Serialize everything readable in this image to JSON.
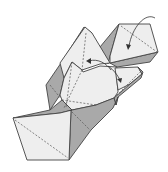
{
  "diagram": {
    "type": "origami-fold-step",
    "colors": {
      "paper_front": "#eeeeee",
      "paper_back": "#a9a9a9",
      "outline": "#444444",
      "arrow": "#333333"
    },
    "arrows": [
      {
        "name": "top-right-fold-arrow",
        "kind": "curved"
      },
      {
        "name": "center-left-fold-arrow",
        "kind": "curved"
      },
      {
        "name": "center-right-fold-arrow",
        "kind": "curved"
      }
    ]
  }
}
